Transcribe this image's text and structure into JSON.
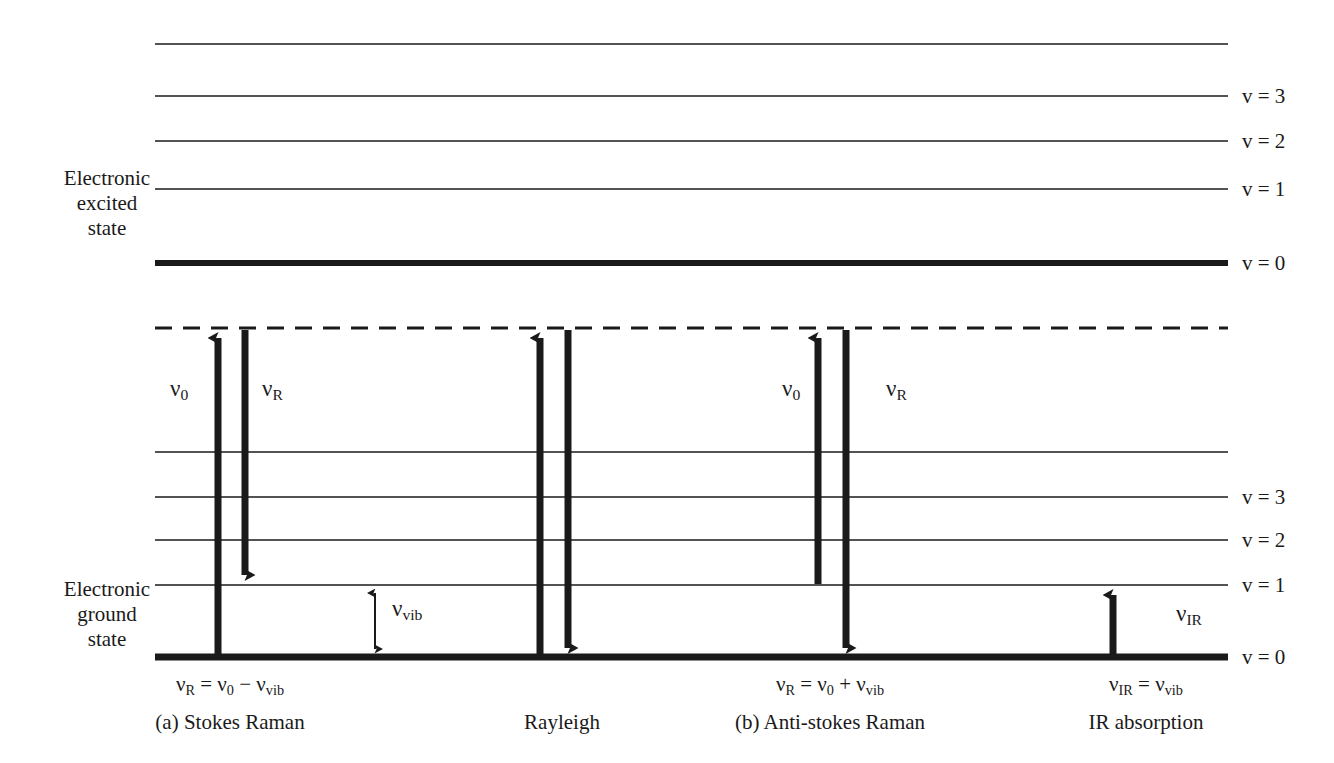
{
  "figure": {
    "type": "energy-level-diagram",
    "background_color": "#ffffff",
    "line_color": "#1a1a1a"
  },
  "states": {
    "excited": {
      "label_lines": [
        "Electronic",
        "excited",
        "state"
      ],
      "label_text": "Electronic excited state"
    },
    "ground": {
      "label_lines": [
        "Electronic",
        "ground",
        "state"
      ],
      "label_text": "Electronic ground state"
    }
  },
  "levels": {
    "excited_state": [
      {
        "name": "top-unlabeled",
        "label": "",
        "y": 44,
        "thick": false
      },
      {
        "name": "v3",
        "label": "v = 3",
        "y": 96,
        "thick": false
      },
      {
        "name": "v2",
        "label": "v = 2",
        "y": 141,
        "thick": false
      },
      {
        "name": "v1",
        "label": "v = 1",
        "y": 189,
        "thick": false
      },
      {
        "name": "v0",
        "label": "v = 0",
        "y": 263,
        "thick": true
      }
    ],
    "ground_state": [
      {
        "name": "top-unlabeled",
        "label": "",
        "y": 452,
        "thick": false
      },
      {
        "name": "v3",
        "label": "v = 3",
        "y": 497,
        "thick": false
      },
      {
        "name": "v2",
        "label": "v = 2",
        "y": 540,
        "thick": false
      },
      {
        "name": "v1",
        "label": "v = 1",
        "y": 585,
        "thick": false
      },
      {
        "name": "v0",
        "label": "v = 0",
        "y": 657,
        "thick": true
      }
    ],
    "virtual_state": {
      "name": "virtual-dashed-level",
      "label": "",
      "y": 328,
      "style": "dashed"
    }
  },
  "processes": [
    {
      "id": "stokes-raman",
      "caption": "(a) Stokes Raman",
      "formula": "v_R = v_0 − v_vib",
      "up_arrow_label": "v_0",
      "down_arrow_label": "v_R",
      "up_from": "v = 0",
      "up_to": "virtual",
      "down_from": "virtual",
      "down_to": "v = 1"
    },
    {
      "id": "rayleigh",
      "caption": "Rayleigh",
      "formula": "",
      "up_arrow_label": "",
      "down_arrow_label": "",
      "up_from": "v = 0",
      "up_to": "virtual",
      "down_from": "virtual",
      "down_to": "v = 0"
    },
    {
      "id": "anti-stokes-raman",
      "caption": "(b) Anti-stokes Raman",
      "formula": "v_R = v_0 + v_vib",
      "up_arrow_label": "v_0",
      "down_arrow_label": "v_R",
      "up_from": "v = 1",
      "up_to": "virtual",
      "down_from": "virtual",
      "down_to": "v = 0"
    },
    {
      "id": "ir-absorption",
      "caption": "IR absorption",
      "formula": "v_IR = v_vib",
      "up_arrow_label": "v_IR",
      "down_arrow_label": "",
      "up_from": "v = 0",
      "up_to": "v = 1",
      "down_from": "",
      "down_to": ""
    }
  ],
  "annotations": {
    "vib_gap": {
      "label": "v_vib",
      "description": "double-headed arrow between v = 1 and v = 0 of ground state"
    }
  },
  "text": {
    "nu": "ν",
    "v_sub_0": "0",
    "v_sub_R": "R",
    "v_sub_vib": "vib",
    "v_sub_IR": "IR",
    "captions": {
      "stokes": "(a) Stokes Raman",
      "rayleigh": "Rayleigh",
      "antistokes": "(b) Anti-stokes Raman",
      "ir": "IR absorption"
    },
    "level_labels": {
      "v3": "v = 3",
      "v2": "v = 2",
      "v1": "v = 1",
      "v0": "v = 0"
    },
    "state_excited_1": "Electronic",
    "state_excited_2": "excited",
    "state_excited_3": "state",
    "state_ground_1": "Electronic",
    "state_ground_2": "ground",
    "state_ground_3": "state"
  }
}
